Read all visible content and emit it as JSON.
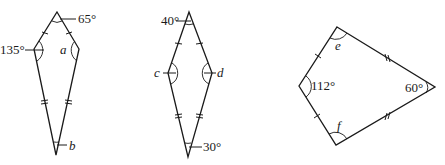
{
  "figures": [
    {
      "id": "kite-1",
      "vertices": {
        "top": [
          57,
          12
        ],
        "left": [
          34,
          49
        ],
        "right": [
          79,
          49
        ],
        "bottom": [
          56,
          155
        ]
      },
      "labels": {
        "top": "65°",
        "left": "135°",
        "right": "a",
        "bottom": "b"
      }
    },
    {
      "id": "kite-2",
      "vertices": {
        "top": [
          189,
          12
        ],
        "left": [
          168,
          73
        ],
        "right": [
          212,
          73
        ],
        "bottom": [
          188,
          157
        ]
      },
      "labels": {
        "top": "40°",
        "left": "c",
        "right": "d",
        "bottom": "30°"
      }
    },
    {
      "id": "kite-3",
      "vertices": {
        "top": [
          337,
          27
        ],
        "left": [
          299,
          86
        ],
        "right": [
          435,
          87
        ],
        "bottom": [
          336,
          145
        ]
      },
      "labels": {
        "top": "e",
        "left": "112°",
        "right": "60°",
        "bottom": "f"
      }
    }
  ],
  "colors": {
    "stroke": "#1a1a1a",
    "background": "#ffffff"
  }
}
